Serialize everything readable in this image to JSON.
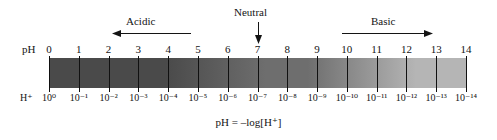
{
  "figure": {
    "formula": "pH = –log[H⁺]",
    "row_labels": {
      "ph": "pH",
      "hydrogen": "H⁺"
    }
  },
  "regions": [
    {
      "label": "Acidic",
      "arrow": "left-arrow-icon",
      "name": "acidic"
    },
    {
      "label": "Neutral",
      "arrow": "down-arrow-icon",
      "name": "neutral"
    },
    {
      "label": "Basic",
      "arrow": "right-arrow-icon",
      "name": "basic"
    }
  ],
  "colors": {
    "bar_acidic": "#4a4a4a",
    "bar_mid": "#6e6e6e",
    "bar_basic": "#b5b5b5",
    "text": "#141414",
    "tick": "#111111",
    "background": "#ffffff"
  },
  "chart_data": {
    "type": "bar",
    "xlabel": "pH",
    "ylabel": "",
    "xlim": [
      0,
      14
    ],
    "grid": false,
    "legend": "none",
    "categories": [
      "0",
      "1",
      "2",
      "3",
      "4",
      "5",
      "6",
      "7",
      "8",
      "9",
      "10",
      "11",
      "12",
      "13",
      "14"
    ],
    "values": [
      0,
      1,
      2,
      3,
      4,
      5,
      6,
      7,
      8,
      9,
      10,
      11,
      12,
      13,
      14
    ],
    "tick_labels_ph": [
      "0",
      "1",
      "2",
      "3",
      "4",
      "5",
      "6",
      "7",
      "8",
      "9",
      "10",
      "11",
      "12",
      "13",
      "14"
    ],
    "tick_labels_concentration": [
      "10⁰",
      "10⁻¹",
      "10⁻²",
      "10⁻³",
      "10⁻⁴",
      "10⁻⁵",
      "10⁻⁶",
      "10⁻⁷",
      "10⁻⁸",
      "10⁻⁹",
      "10⁻¹⁰",
      "10⁻¹¹",
      "10⁻¹²",
      "10⁻¹³",
      "10⁻¹⁴"
    ],
    "annotations": [
      {
        "text": "Acidic",
        "range": [
          0,
          6
        ],
        "direction": "left"
      },
      {
        "text": "Neutral",
        "at": 7,
        "direction": "down"
      },
      {
        "text": "Basic",
        "range": [
          8,
          14
        ],
        "direction": "right"
      }
    ]
  }
}
